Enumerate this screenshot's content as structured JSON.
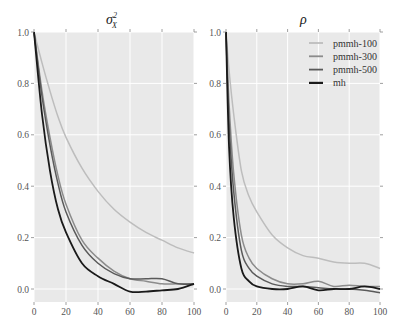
{
  "chart_data": [
    {
      "type": "line",
      "title": "σ²_X",
      "xlabel": "",
      "ylabel": "",
      "xlim": [
        0,
        100
      ],
      "ylim": [
        -0.05,
        1.0
      ],
      "grid": true,
      "x": [
        0,
        5,
        10,
        15,
        20,
        30,
        40,
        50,
        60,
        70,
        80,
        90,
        100
      ],
      "series": [
        {
          "name": "pmmh-100",
          "color": "#bdbdbd",
          "values": [
            1.0,
            0.88,
            0.77,
            0.67,
            0.59,
            0.47,
            0.38,
            0.31,
            0.26,
            0.22,
            0.19,
            0.16,
            0.14
          ]
        },
        {
          "name": "pmmh-300",
          "color": "#8c8c8c",
          "values": [
            1.0,
            0.77,
            0.59,
            0.44,
            0.33,
            0.19,
            0.12,
            0.07,
            0.04,
            0.03,
            0.02,
            0.02,
            0.02
          ]
        },
        {
          "name": "pmmh-500",
          "color": "#5a5a5a",
          "values": [
            1.0,
            0.75,
            0.56,
            0.41,
            0.3,
            0.17,
            0.1,
            0.06,
            0.04,
            0.04,
            0.04,
            0.02,
            0.02
          ]
        },
        {
          "name": "mh",
          "color": "#1a1a1a",
          "values": [
            1.0,
            0.68,
            0.46,
            0.31,
            0.22,
            0.1,
            0.05,
            0.02,
            -0.01,
            -0.01,
            -0.005,
            0.0,
            0.02
          ]
        }
      ],
      "xticks": [
        "0",
        "20",
        "40",
        "60",
        "80",
        "100"
      ],
      "yticks": [
        "0.0",
        "0.2",
        "0.4",
        "0.6",
        "0.8",
        "1.0"
      ]
    },
    {
      "type": "line",
      "title": "ρ",
      "xlabel": "",
      "ylabel": "",
      "xlim": [
        0,
        100
      ],
      "ylim": [
        -0.05,
        1.0
      ],
      "grid": true,
      "legend_position": "upper right",
      "x": [
        0,
        2,
        5,
        10,
        15,
        20,
        30,
        40,
        50,
        60,
        70,
        80,
        90,
        100
      ],
      "series": [
        {
          "name": "pmmh-100",
          "color": "#bdbdbd",
          "values": [
            1.0,
            0.85,
            0.68,
            0.46,
            0.36,
            0.3,
            0.21,
            0.16,
            0.13,
            0.12,
            0.105,
            0.1,
            0.1,
            0.08
          ]
        },
        {
          "name": "pmmh-300",
          "color": "#8c8c8c",
          "values": [
            1.0,
            0.72,
            0.45,
            0.21,
            0.12,
            0.08,
            0.04,
            0.02,
            0.02,
            0.03,
            0.01,
            0.015,
            0.01,
            0.01
          ]
        },
        {
          "name": "pmmh-500",
          "color": "#5a5a5a",
          "values": [
            1.0,
            0.65,
            0.38,
            0.15,
            0.08,
            0.05,
            0.02,
            0.01,
            0.01,
            0.005,
            0.0,
            0.0,
            -0.005,
            -0.015
          ]
        },
        {
          "name": "mh",
          "color": "#1a1a1a",
          "values": [
            1.0,
            0.55,
            0.28,
            0.08,
            0.03,
            0.01,
            0.0,
            0.0,
            0.01,
            -0.005,
            0.0,
            0.0,
            0.01,
            0.0
          ]
        }
      ],
      "xticks": [
        "0",
        "20",
        "40",
        "60",
        "80",
        "100"
      ],
      "yticks": [
        "0.0",
        "0.2",
        "0.4",
        "0.6",
        "0.8",
        "1.0"
      ]
    }
  ],
  "legend": {
    "items": [
      {
        "label": "pmmh-100",
        "color": "#bdbdbd"
      },
      {
        "label": "pmmh-300",
        "color": "#8c8c8c"
      },
      {
        "label": "pmmh-500",
        "color": "#5a5a5a"
      },
      {
        "label": "mh",
        "color": "#1a1a1a"
      }
    ]
  },
  "titles": {
    "left_main": "σ",
    "left_sup": "2",
    "left_sub": "X",
    "right": "ρ"
  },
  "style": {
    "plot_bg": "#e9e9e9",
    "grid": "#ffffff"
  }
}
